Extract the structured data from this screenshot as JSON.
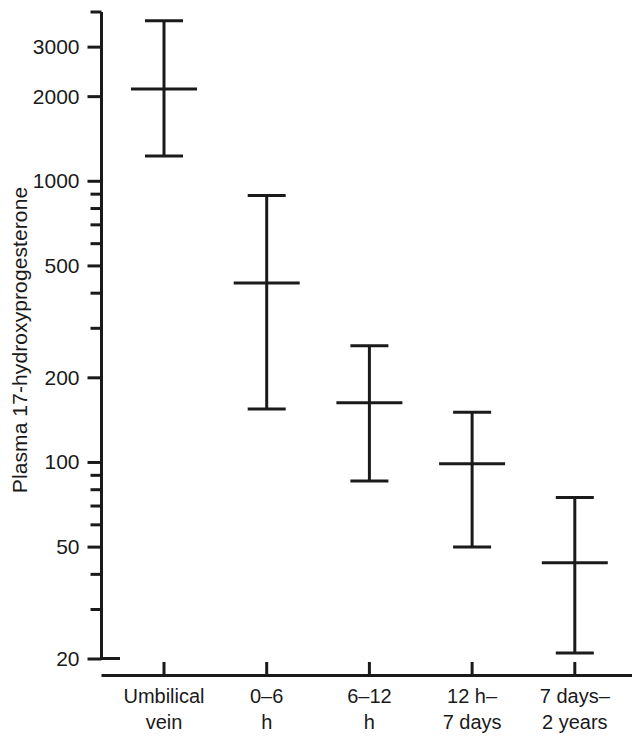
{
  "chart_data": {
    "type": "line",
    "title": "",
    "xlabel": "",
    "ylabel": "Plasma 17-hydroxyprogesterone",
    "yscale": "log",
    "ylim": [
      20,
      4000
    ],
    "ytick_labels": [
      "3000",
      "2000",
      "1000",
      "500",
      "200",
      "100",
      "50",
      "20"
    ],
    "ytick_values": [
      3000,
      2000,
      1000,
      500,
      200,
      100,
      50,
      20
    ],
    "yminor_values": [
      4000,
      900,
      800,
      700,
      600,
      400,
      300,
      90,
      80,
      70,
      60,
      40,
      30
    ],
    "grid": false,
    "legend": "none",
    "categories": [
      "Umbilical\nvein",
      "0–6\nh",
      "6–12\nh",
      "12 h–\n7 days",
      "7 days–\n2 years"
    ],
    "category_lines": [
      [
        "Umbilical",
        "vein"
      ],
      [
        "0–6",
        "h"
      ],
      [
        "6–12",
        "h"
      ],
      [
        "12 h–",
        "7 days"
      ],
      [
        "7 days–",
        "2 years"
      ]
    ],
    "series": [
      {
        "name": "Plasma 17-hydroxyprogesterone range",
        "median": [
          2130,
          435,
          163,
          99,
          44
        ],
        "upper": [
          3720,
          890,
          260,
          151,
          75
        ],
        "lower": [
          1230,
          155,
          86,
          50,
          21
        ]
      }
    ],
    "marker": "horizontal-bar-median-with-whisker-caps",
    "line_color": "#1a1a1a"
  },
  "axis": {
    "y_axis_top_value": 4000,
    "y_axis_bottom_value": 20,
    "units": "nmol/l"
  }
}
